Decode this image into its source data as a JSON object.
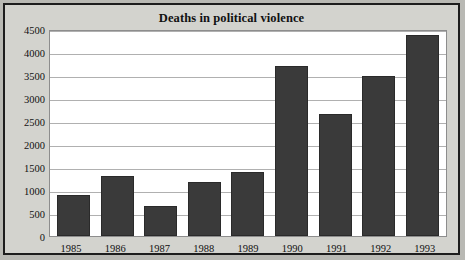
{
  "chart_data": {
    "type": "bar",
    "title": "Deaths in political violence",
    "xlabel": "",
    "ylabel": "",
    "categories": [
      "1985",
      "1986",
      "1987",
      "1988",
      "1989",
      "1990",
      "1991",
      "1992",
      "1993"
    ],
    "values": [
      900,
      1300,
      650,
      1180,
      1400,
      3700,
      2650,
      3480,
      4380
    ],
    "ylim": [
      0,
      4500
    ],
    "yticks": [
      0,
      500,
      1000,
      1500,
      2000,
      2500,
      3000,
      3500,
      4000,
      4500
    ],
    "ytick_labels": [
      "0",
      "500",
      "1000",
      "1500",
      "2000",
      "2500",
      "3000",
      "3500",
      "4000",
      "4500"
    ],
    "grid": true,
    "legend": false,
    "colors": {
      "bar": "#3a3a3a",
      "plot_background": "#ffffff",
      "figure_background": "#d3d3ce",
      "gridline": "#b0b0b0",
      "border": "#1d1d1d",
      "text": "#111111"
    }
  }
}
